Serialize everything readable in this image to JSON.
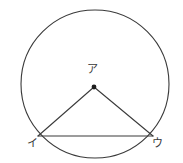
{
  "figure": {
    "background_color": "#ffffff",
    "stroke_color": "#3a3a3a",
    "stroke_width": 1.1,
    "labels": {
      "center": "ア",
      "left": "イ",
      "right": "ウ"
    },
    "circle": {
      "cx": 95,
      "cy": 84,
      "r": 74
    },
    "points": {
      "center": {
        "name": "ア",
        "x": 94,
        "y": 87,
        "dot": true,
        "dot_radius": 2.4
      },
      "left": {
        "name": "イ",
        "x": 38,
        "y": 136,
        "dot": false
      },
      "right": {
        "name": "ウ",
        "x": 153,
        "y": 136,
        "dot": false
      }
    },
    "segments": [
      {
        "name": "radius-center-to-left",
        "x1": 94,
        "y1": 87,
        "x2": 38,
        "y2": 136
      },
      {
        "name": "radius-center-to-right",
        "x1": 94,
        "y1": 87,
        "x2": 153,
        "y2": 136
      },
      {
        "name": "chord-left-to-right",
        "x1": 38,
        "y1": 136,
        "x2": 153,
        "y2": 136
      }
    ]
  }
}
